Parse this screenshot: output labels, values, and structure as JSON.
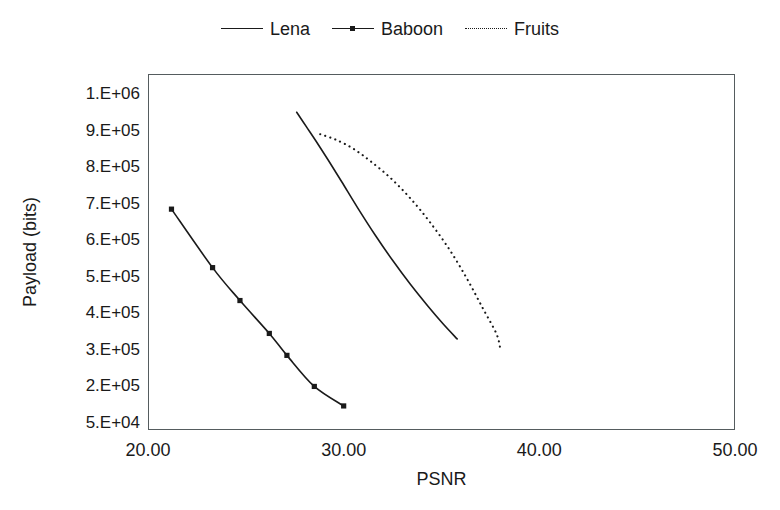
{
  "chart_data": {
    "type": "line",
    "title": "",
    "xlabel": "PSNR",
    "ylabel": "Payload (bits)",
    "xlim": [
      20.0,
      50.0
    ],
    "ylim": [
      50000,
      1000000
    ],
    "xticks": [
      "20.00",
      "30.00",
      "40.00",
      "50.00"
    ],
    "xtick_values": [
      20.0,
      30.0,
      40.0,
      50.0
    ],
    "yticks": [
      "1.E+06",
      "9.E+05",
      "8.E+05",
      "7.E+05",
      "6.E+05",
      "5.E+05",
      "4.E+05",
      "3.E+05",
      "2.E+05",
      "5.E+04"
    ],
    "ytick_values": [
      1000000,
      900000,
      800000,
      700000,
      600000,
      500000,
      400000,
      300000,
      200000,
      50000
    ],
    "grid": false,
    "legend_position": "top-center",
    "series": [
      {
        "name": "Lena",
        "style": "solid",
        "markers": false,
        "x": [
          27.6,
          28.1,
          28.6,
          29.2,
          29.9,
          30.7,
          31.6,
          32.5,
          33.4,
          34.3,
          35.1,
          35.8
        ],
        "y": [
          950000,
          910000,
          870000,
          820000,
          760000,
          690000,
          615000,
          545000,
          480000,
          420000,
          370000,
          330000
        ]
      },
      {
        "name": "Baboon",
        "style": "solid",
        "markers": true,
        "x": [
          21.2,
          23.3,
          24.7,
          26.2,
          27.1,
          28.5,
          30.0
        ],
        "y": [
          685000,
          525000,
          435000,
          345000,
          285000,
          200000,
          120000
        ]
      },
      {
        "name": "Fruits",
        "style": "dotted",
        "markers": false,
        "x": [
          28.8,
          29.6,
          30.5,
          31.4,
          32.4,
          33.4,
          34.4,
          35.4,
          36.3,
          37.1,
          37.8,
          38.0
        ],
        "y": [
          890000,
          875000,
          850000,
          815000,
          770000,
          715000,
          650000,
          575000,
          495000,
          415000,
          345000,
          305000
        ]
      }
    ]
  },
  "legend": {
    "entries": [
      {
        "label": "Lena"
      },
      {
        "label": "Baboon"
      },
      {
        "label": "Fruits"
      }
    ]
  },
  "axes": {
    "x_title": "PSNR",
    "y_title": "Payload (bits)"
  },
  "colors": {
    "line": "#1a1a1a",
    "frame": "#555c5e",
    "background": "#ffffff"
  }
}
